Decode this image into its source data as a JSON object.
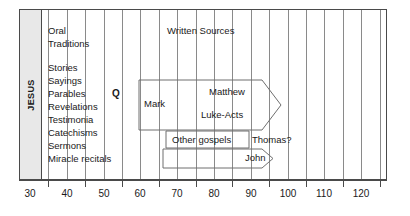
{
  "figure": {
    "era_label": "JESUS",
    "section_oral": "Oral Traditions",
    "section_written": "Written Sources"
  },
  "axis": {
    "label": "",
    "min": 27,
    "max": 127,
    "ticks_labeled": [
      30,
      40,
      50,
      60,
      70,
      80,
      90,
      100,
      110,
      120
    ],
    "ticks_minor": [
      35,
      45,
      55,
      65,
      75,
      85,
      95,
      105,
      115,
      125
    ],
    "gridlines": [
      30,
      35,
      40,
      45,
      50,
      55,
      60,
      65,
      70,
      75,
      80,
      85,
      90,
      95,
      100,
      105,
      110,
      115,
      120,
      125
    ]
  },
  "oral_items": [
    "Oral",
    "Traditions",
    "Stories",
    "Sayings",
    "Parables",
    "Revelations",
    "Testimonia",
    "Catechisms",
    "Sermons",
    "Miracle recitals"
  ],
  "markers": [
    {
      "name": "Q",
      "label": "Q"
    }
  ],
  "chart_data": {
    "type": "timeline",
    "xlabel": "",
    "ylabel": "",
    "xlim": [
      27,
      127
    ],
    "grid": true,
    "legend": "none",
    "annotations": [
      {
        "text": "JESUS",
        "x": 30,
        "kind": "era-band",
        "start": 27,
        "end": 31
      },
      {
        "text": "Oral Traditions",
        "x": 36,
        "kind": "section-heading"
      },
      {
        "text": "Written Sources",
        "x": 72,
        "kind": "section-heading"
      },
      {
        "text": "Q",
        "x": 52,
        "kind": "point-marker"
      }
    ],
    "bands": [
      {
        "name": "Oral traditions",
        "start": 27,
        "end": 62,
        "items": [
          "Stories",
          "Sayings",
          "Parables",
          "Revelations",
          "Testimonia",
          "Catechisms",
          "Sermons",
          "Miracle recitals"
        ]
      }
    ],
    "series": [
      {
        "name": "Matthew",
        "label": "Matthew",
        "start": 60,
        "end": 100,
        "arrow": true
      },
      {
        "name": "Mark",
        "label": "Mark",
        "start": 60,
        "end": 100,
        "arrow": false
      },
      {
        "name": "Luke-Acts",
        "label": "Luke-Acts",
        "start": 60,
        "end": 100,
        "arrow": true
      },
      {
        "name": "Other gospels",
        "label": "Other gospels",
        "start": 59,
        "end": 90,
        "arrow": false
      },
      {
        "name": "Thomas?",
        "label": "Thomas?",
        "start": 90,
        "end": 100,
        "arrow": false
      },
      {
        "name": "John",
        "label": "John",
        "start": 58,
        "end": 101,
        "arrow": true
      }
    ]
  },
  "labels": {
    "matthew": "Matthew",
    "mark": "Mark",
    "luke_acts": "Luke-Acts",
    "other_gospels": "Other gospels",
    "thomas": "Thomas?",
    "john": "John",
    "written_sources": "Written Sources",
    "oral": "Oral",
    "traditions": "Traditions",
    "stories": "Stories",
    "sayings": "Sayings",
    "parables": "Parables",
    "revelations": "Revelations",
    "testimonia": "Testimonia",
    "catechisms": "Catechisms",
    "sermons": "Sermons",
    "miracle_recitals": "Miracle recitals",
    "q": "Q",
    "jesus": "JESUS"
  },
  "axis_labels": {
    "t30": "30",
    "t40": "40",
    "t50": "50",
    "t60": "60",
    "t70": "70",
    "t80": "80",
    "t90": "90",
    "t100": "100",
    "t110": "110",
    "t120": "120"
  },
  "colors": {
    "frame": "#4a4a4a",
    "grid": "#8a8a8a",
    "band": "#e8e8e8",
    "text": "#1a1a1a",
    "box": "#6f6f6f",
    "background": "#ffffff"
  }
}
